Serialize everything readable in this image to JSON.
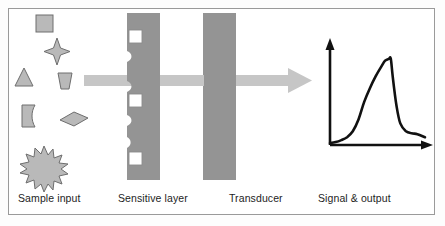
{
  "figure": {
    "kind": "biosensor-schematic",
    "border_color": "#9a9a9a",
    "background": "#ffffff"
  },
  "labels": {
    "sample_input": "Sample input",
    "sensitive_layer": "Sensitive layer",
    "transducer": "Transducer",
    "signal_output": "Signal & output"
  },
  "colors": {
    "block_gray": "#949494",
    "particle_fill": "#b9b9b9",
    "particle_stroke": "#6e6e6e",
    "arrow_gray": "#c6c6c6",
    "curve_black": "#111111",
    "white_square_fill": "#ffffff",
    "white_square_stroke": "#8c8c8c"
  },
  "stages": [
    {
      "name": "sample-input",
      "label": "Sample input"
    },
    {
      "name": "sensitive-layer",
      "label": "Sensitive layer"
    },
    {
      "name": "transducer",
      "label": "Transducer"
    },
    {
      "name": "signal-output",
      "label": "Signal & output"
    }
  ],
  "particles": [
    {
      "name": "square-particle",
      "shape": "square"
    },
    {
      "name": "four-point-star-particle",
      "shape": "star4"
    },
    {
      "name": "triangle-particle",
      "shape": "triangle"
    },
    {
      "name": "trapezoid-particle",
      "shape": "trapezoid"
    },
    {
      "name": "curved-rect-particle",
      "shape": "curved-rect"
    },
    {
      "name": "diamond-particle",
      "shape": "diamond"
    },
    {
      "name": "starburst-particle",
      "shape": "starburst"
    }
  ],
  "binding_sites": [
    {
      "name": "binding-site-top"
    },
    {
      "name": "binding-site-middle"
    },
    {
      "name": "binding-site-bottom"
    }
  ],
  "flow_arrow": {
    "name": "flow-arrow",
    "direction": "left-to-right"
  },
  "chart_data": {
    "type": "line",
    "title": "Signal & output",
    "xlabel": "",
    "ylabel": "",
    "xlim": [
      0,
      100
    ],
    "ylim": [
      0,
      100
    ],
    "grid": false,
    "legend": null,
    "series": [
      {
        "name": "signal-response",
        "x": [
          0,
          6,
          12,
          18,
          24,
          30,
          36,
          42,
          48,
          54,
          58,
          62,
          64,
          66,
          70,
          74,
          80,
          86,
          92,
          100
        ],
        "y": [
          2,
          3,
          5,
          8,
          14,
          26,
          44,
          58,
          70,
          80,
          86,
          88,
          88,
          70,
          40,
          22,
          14,
          12,
          11,
          8
        ]
      }
    ]
  }
}
